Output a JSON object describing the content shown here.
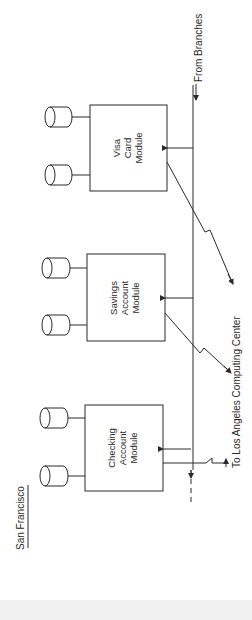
{
  "location_label": "San Francisco",
  "external": {
    "from_branches": "From Branches",
    "to_la": "To Los Angeles Computing Center"
  },
  "modules": [
    {
      "id": "visa",
      "lines": [
        "Visa",
        "Card",
        "Module"
      ]
    },
    {
      "id": "savings",
      "lines": [
        "Savings",
        "Account",
        "Module"
      ]
    },
    {
      "id": "checking",
      "lines": [
        "Checking",
        "Account",
        "Module"
      ]
    }
  ],
  "colors": {
    "stroke": "#2a2a2a",
    "background": "#ffffff"
  }
}
